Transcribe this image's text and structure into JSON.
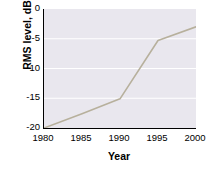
{
  "chart_data": {
    "type": "line",
    "title": "",
    "xlabel": "Year",
    "ylabel": "RMS level, dB",
    "xlim": [
      1980,
      2000
    ],
    "ylim": [
      -20,
      0
    ],
    "grid": true,
    "grid_axis": "y",
    "legend": "none",
    "x_ticks": [
      "1980",
      "1985",
      "1990",
      "1995",
      "2000"
    ],
    "y_ticks": [
      "0",
      "-5",
      "-10",
      "-15",
      "-20"
    ],
    "x_tick_values": [
      1980,
      1985,
      1990,
      1995,
      2000
    ],
    "y_tick_values": [
      0,
      -5,
      -10,
      -15,
      -20
    ],
    "series": [
      {
        "name": "RMS level",
        "color": "#b7b09c",
        "x": [
          1980,
          1985,
          1990,
          1995,
          2000
        ],
        "values": [
          -20,
          -17.6,
          -15.1,
          -5.3,
          -3.0
        ]
      }
    ]
  },
  "axes": {
    "y_title": "RMS level, dB",
    "x_title": "Year"
  },
  "style": {
    "plot_background": "#e9e7ee",
    "gridline_color": "#ffffff",
    "axis_color": "#000000",
    "line_color": "#b7b09c",
    "page_background": "#ffffff"
  }
}
